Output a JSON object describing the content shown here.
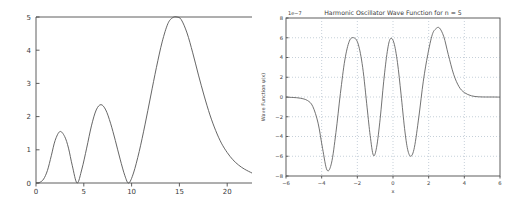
{
  "figure": {
    "background_color": "#ffffff",
    "line_color": "#555555",
    "grid_color": "#7f9fbf",
    "panel_count": 2
  },
  "chart_data": [
    {
      "id": "left-panel",
      "type": "line",
      "title": "",
      "xlabel": "",
      "ylabel": "",
      "xlim": [
        0,
        22.6
      ],
      "ylim": [
        0,
        5
      ],
      "xticks": [
        0,
        5,
        10,
        15,
        20
      ],
      "xticklabels": [
        "0",
        "5",
        "10",
        "15",
        "20"
      ],
      "yticks": [
        0,
        1,
        2,
        3,
        4,
        5
      ],
      "yticklabels": [
        "0",
        "1",
        "2",
        "3",
        "4",
        "5"
      ],
      "grid": false,
      "annotations": [],
      "series": [
        {
          "name": "probability density",
          "peaks": [
            {
              "x": 2.5,
              "y": 1.55
            },
            {
              "x": 6.8,
              "y": 2.36
            },
            {
              "x": 14.75,
              "y": 5.0
            }
          ],
          "zeros": [
            0.1,
            4.3,
            9.7
          ],
          "x": [
            0.0,
            0.4,
            0.8,
            1.2,
            1.6,
            2.0,
            2.5,
            3.0,
            3.4,
            3.8,
            4.3,
            4.8,
            5.3,
            5.8,
            6.3,
            6.8,
            7.3,
            7.8,
            8.3,
            8.8,
            9.3,
            9.7,
            10.2,
            10.8,
            11.4,
            12.0,
            12.6,
            13.2,
            13.8,
            14.3,
            14.75,
            15.2,
            15.8,
            16.4,
            17.0,
            17.6,
            18.2,
            18.8,
            19.4,
            20.0,
            20.6,
            21.2,
            21.8,
            22.6
          ],
          "y": [
            0.0,
            0.02,
            0.12,
            0.38,
            0.82,
            1.28,
            1.55,
            1.4,
            1.05,
            0.52,
            0.0,
            0.42,
            1.05,
            1.72,
            2.2,
            2.36,
            2.2,
            1.8,
            1.28,
            0.72,
            0.22,
            0.0,
            0.3,
            0.95,
            1.75,
            2.62,
            3.48,
            4.25,
            4.8,
            4.98,
            5.0,
            4.92,
            4.52,
            3.92,
            3.25,
            2.62,
            2.05,
            1.58,
            1.2,
            0.92,
            0.7,
            0.54,
            0.42,
            0.3
          ]
        }
      ]
    },
    {
      "id": "right-panel",
      "type": "line",
      "title": "Harmonic Oscillator Wave Function for n = 5",
      "xlabel": "x",
      "ylabel": "Wave Function ψ(x)",
      "y_offset_text": "1e−7",
      "xlim": [
        -6,
        6
      ],
      "ylim": [
        -8,
        8
      ],
      "xticks": [
        -6,
        -4,
        -2,
        0,
        2,
        4,
        6
      ],
      "xticklabels": [
        "−6",
        "−4",
        "−2",
        "0",
        "2",
        "4",
        "6"
      ],
      "yticks": [
        -8,
        -6,
        -4,
        -2,
        0,
        2,
        4,
        6,
        8
      ],
      "yticklabels": [
        "−8",
        "−6",
        "−4",
        "−2",
        "0",
        "2",
        "4",
        "6",
        "8"
      ],
      "grid": true,
      "grid_style": "dotted",
      "annotations": [],
      "series": [
        {
          "name": "ψ₅(x)",
          "peaks": [
            {
              "x": -3.7,
              "y": -7.4
            },
            {
              "x": -1.95,
              "y": 6.0
            },
            {
              "x": -1.1,
              "y": -5.9
            },
            {
              "x": -0.15,
              "y": 5.9
            },
            {
              "x": 1.0,
              "y": -6.0
            },
            {
              "x": 2.6,
              "y": 7.0
            }
          ],
          "x": [
            -6.0,
            -5.6,
            -5.2,
            -4.8,
            -4.5,
            -4.2,
            -3.95,
            -3.7,
            -3.45,
            -3.2,
            -2.95,
            -2.7,
            -2.45,
            -2.2,
            -1.95,
            -1.7,
            -1.45,
            -1.28,
            -1.1,
            -0.92,
            -0.72,
            -0.52,
            -0.32,
            -0.15,
            0.05,
            0.25,
            0.45,
            0.65,
            0.82,
            1.0,
            1.2,
            1.45,
            1.7,
            1.95,
            2.2,
            2.4,
            2.6,
            2.85,
            3.1,
            3.4,
            3.7,
            4.0,
            4.4,
            4.8,
            5.2,
            5.6,
            6.0
          ],
          "y": [
            -0.02,
            -0.05,
            -0.12,
            -0.35,
            -0.95,
            -2.65,
            -5.2,
            -7.4,
            -6.7,
            -3.6,
            0.35,
            3.75,
            5.65,
            6.0,
            5.35,
            3.0,
            -1.1,
            -3.9,
            -5.9,
            -5.1,
            -2.2,
            1.6,
            4.6,
            5.9,
            5.5,
            3.5,
            0.3,
            -3.2,
            -5.3,
            -6.0,
            -5.1,
            -2.0,
            1.6,
            4.3,
            6.3,
            6.9,
            7.0,
            6.1,
            4.3,
            2.3,
            1.05,
            0.45,
            0.12,
            0.02,
            0.0,
            0.0,
            -0.01
          ]
        }
      ]
    }
  ]
}
